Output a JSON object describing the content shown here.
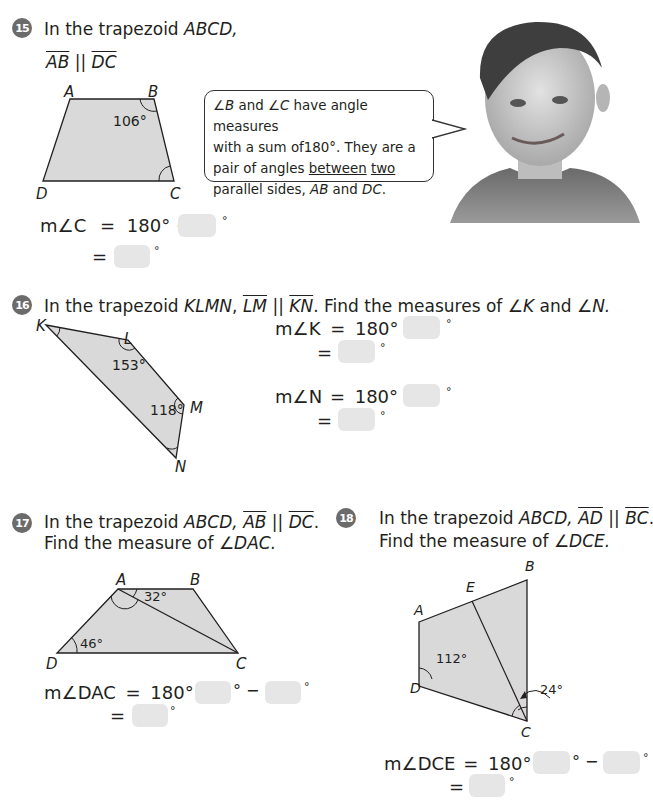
{
  "problems": [
    {
      "number": "15",
      "title_prefix": "In the trapezoid ",
      "title_shape": "ABCD,",
      "parallel": {
        "seg1": "AB",
        "sym": "||",
        "seg2": "DC"
      },
      "figure": {
        "vertices": {
          "A": "A",
          "B": "B",
          "C": "C",
          "D": "D"
        },
        "angle_label": "106°"
      },
      "speech_bubble": {
        "line1_a": "∠B",
        "line1_b": " and ",
        "line1_c": "∠C",
        "line1_d": " have angle measures",
        "line2": "with a sum of180°. They are a",
        "line3_a": "pair of angles ",
        "line3_b": "between",
        "line3_c": " ",
        "line3_d": "two",
        "line4_a": "parallel sides, ",
        "line4_b": "AB",
        "line4_c": " and ",
        "line4_d": "DC",
        "line4_e": "."
      },
      "equation": {
        "lhs": "m∠C",
        "eq": "=",
        "rhs": "180° −",
        "degree": "°",
        "line2_eq": "="
      }
    },
    {
      "number": "16",
      "title_prefix": "In the trapezoid ",
      "title_shape": "KLMN",
      "title_mid": ", ",
      "seg1": "LM",
      "sym": " || ",
      "seg2": "KN",
      "title_suffix": ". Find the measures of ",
      "angle1": "∠K",
      "and": " and ",
      "angle2": "∠N.",
      "figure": {
        "vertices": {
          "K": "K",
          "L": "L",
          "M": "M",
          "N": "N"
        },
        "angle_L": "153°",
        "angle_M": "118°"
      },
      "equations": [
        {
          "lhs": "m∠K",
          "eq": "=",
          "rhs": "180° −",
          "degree": "°",
          "line2_eq": "="
        },
        {
          "lhs": "m∠N",
          "eq": "=",
          "rhs": "180° −",
          "degree": "°",
          "line2_eq": "="
        }
      ]
    },
    {
      "number": "17",
      "title_prefix": "In the trapezoid ",
      "title_shape": "ABCD, ",
      "seg1": "AB",
      "sym": " || ",
      "seg2": "DC",
      "end": ".",
      "line2_prefix": "Find the measure of ",
      "line2_angle": "∠DAC.",
      "figure": {
        "vertices": {
          "A": "A",
          "B": "B",
          "C": "C",
          "D": "D"
        },
        "angle_A": "32°",
        "angle_D": "46°"
      },
      "equation": {
        "lhs": "m∠DAC",
        "eq": "=",
        "rhs": "180° −",
        "minus": "° −",
        "degree": "°",
        "line2_eq": "="
      }
    },
    {
      "number": "18",
      "title_prefix": "In the trapezoid ",
      "title_shape": "ABCD, ",
      "seg1": "AD",
      "sym": " || ",
      "seg2": "BC",
      "end": ".",
      "line2_prefix": "Find the measure of ",
      "line2_angle": "∠DCE.",
      "figure": {
        "vertices": {
          "A": "A",
          "B": "B",
          "C": "C",
          "D": "D",
          "E": "E"
        },
        "angle_D": "112°",
        "angle_C": "24°"
      },
      "equation": {
        "lhs": "m∠DCE",
        "eq": "=",
        "rhs": "180° −",
        "minus": "° −",
        "degree": "°",
        "line2_eq": "="
      }
    }
  ],
  "colors": {
    "shape_fill": "#d9d9d9",
    "answer_box": "#e6e6e6",
    "badge": "#6b6b6b"
  }
}
